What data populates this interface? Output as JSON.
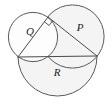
{
  "figure": {
    "type": "geometry-diagram",
    "canvas": {
      "width": 112,
      "height": 106
    },
    "colors": {
      "stroke": "#5a5a5a",
      "triangle_stroke": "#4a4a4a",
      "fill_light": "#fdfdfd",
      "fill_shaded": "#f4f4f4",
      "label_color": "#1d1d1d",
      "background": "#ffffff"
    },
    "labels": {
      "q": "Q",
      "p": "P",
      "r": "R"
    },
    "label_positions": {
      "q": {
        "x": 30,
        "y": 32
      },
      "p": {
        "x": 80,
        "y": 28
      },
      "r": {
        "x": 57,
        "y": 73
      }
    },
    "triangle": {
      "right_angle_vertex": "C",
      "vertices": {
        "A": {
          "x": 18,
          "y": 57
        },
        "B": {
          "x": 97,
          "y": 56
        },
        "C": {
          "x": 48,
          "y": 17
        }
      },
      "right_angle_marker_size": 6
    },
    "circles": [
      {
        "name": "circle-q",
        "label": "Q",
        "cx": 33,
        "cy": 37,
        "r": 24.6,
        "shaded": false,
        "on_side": "AC"
      },
      {
        "name": "circle-p",
        "label": "P",
        "cx": 72.5,
        "cy": 36.5,
        "r": 31.6,
        "shaded": true,
        "on_side": "CB"
      },
      {
        "name": "circle-r",
        "label": "R",
        "cx": 57.5,
        "cy": 56.5,
        "r": 39.5,
        "shaded": true,
        "on_side": "AB"
      }
    ]
  }
}
